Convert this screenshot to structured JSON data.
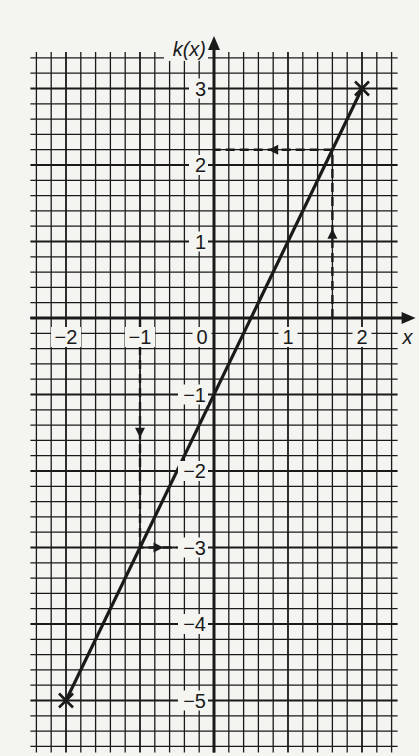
{
  "chart_data": {
    "type": "line",
    "title": "",
    "xlabel": "x",
    "ylabel": "k(x)",
    "xlim": [
      -2.4,
      2.4
    ],
    "ylim": [
      -5.6,
      3.4
    ],
    "minor_per_unit": 5,
    "grid": true,
    "x_ticks": [
      {
        "value": -2,
        "label": "−2"
      },
      {
        "value": -1,
        "label": "−1"
      },
      {
        "value": 0,
        "label": "0"
      },
      {
        "value": 1,
        "label": "1"
      },
      {
        "value": 2,
        "label": "2"
      }
    ],
    "y_ticks": [
      {
        "value": 3,
        "label": "3"
      },
      {
        "value": 2,
        "label": "2"
      },
      {
        "value": 1,
        "label": "1"
      },
      {
        "value": -1,
        "label": "−1"
      },
      {
        "value": -2,
        "label": "−2"
      },
      {
        "value": -3,
        "label": "−3"
      },
      {
        "value": -4,
        "label": "−4"
      },
      {
        "value": -5,
        "label": "−5"
      }
    ],
    "series": [
      {
        "name": "k(x) = 2x − 1",
        "x": [
          -2,
          2
        ],
        "y": [
          -5,
          3
        ],
        "endpoint_markers": "cross"
      }
    ],
    "annotations": [
      {
        "name": "lookup-x-1.6",
        "style": "dashed-arrow",
        "path": [
          [
            1.6,
            0
          ],
          [
            1.6,
            2.2
          ],
          [
            0,
            2.2
          ]
        ],
        "description": "from x = 1.6 up to the line, then across to k(x) = 2.2"
      },
      {
        "name": "lookup-x-neg1",
        "style": "dashed-arrow",
        "path": [
          [
            -1,
            0
          ],
          [
            -1,
            -3
          ],
          [
            -0.5,
            -3
          ]
        ],
        "description": "from x = −1 down to the line, then across to k(x) = −3"
      }
    ]
  }
}
